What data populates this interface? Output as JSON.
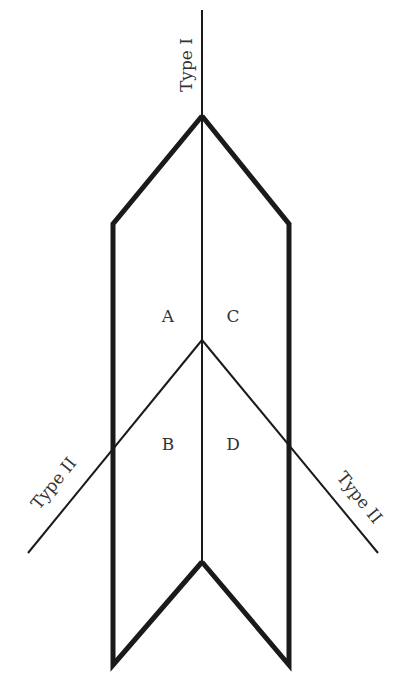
{
  "diagram": {
    "type": "line-diagram",
    "labels": {
      "type1": "Type I",
      "type2_left": "Type II",
      "type2_right": "Type II"
    },
    "regions": {
      "a": "A",
      "b": "B",
      "c": "C",
      "d": "D"
    },
    "colors": {
      "line": "#1a1a1a",
      "text": "#333333",
      "background": "#ffffff"
    }
  }
}
